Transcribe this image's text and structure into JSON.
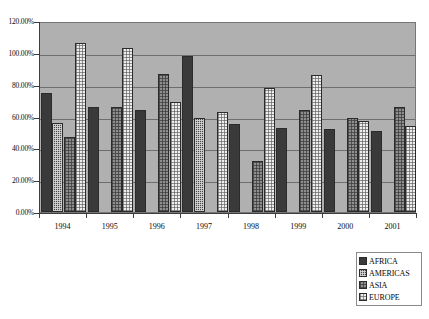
{
  "chart_data": {
    "type": "bar",
    "title": "",
    "xlabel": "",
    "ylabel": "",
    "categories": [
      "1994",
      "1995",
      "1996",
      "1997",
      "1998",
      "1999",
      "2000",
      "2001"
    ],
    "ylim": [
      0,
      120
    ],
    "ytick_labels": [
      "0.00%",
      "20.00%",
      "40.00%",
      "60.00%",
      "80.00%",
      "100.00%",
      "120.00%"
    ],
    "ytick_values": [
      0,
      20,
      40,
      60,
      80,
      100,
      120
    ],
    "grid": true,
    "legend_position": "bottom-right",
    "series": [
      {
        "name": "AFRICA",
        "color": "#3a3a3a",
        "pattern": "solid-dark",
        "values": [
          75,
          66,
          64,
          98,
          55,
          53,
          52,
          51
        ]
      },
      {
        "name": "AMERICAS",
        "color": "#484848",
        "pattern": "dark-checkered",
        "values": [
          56,
          null,
          null,
          59,
          null,
          null,
          null,
          null
        ]
      },
      {
        "name": "ASIA",
        "color": "#8e8e8e",
        "pattern": "gray-dotted",
        "values": [
          47,
          66,
          87,
          null,
          32,
          64,
          59,
          66
        ]
      },
      {
        "name": "EUROPE",
        "color": "#eeeeee",
        "pattern": "light-dotted",
        "values": [
          106,
          103,
          69,
          63,
          78,
          86,
          57,
          54
        ]
      }
    ]
  },
  "legend": {
    "items": [
      {
        "label": "AFRICA"
      },
      {
        "label": "AMERICAS"
      },
      {
        "label": "ASIA"
      },
      {
        "label": "EUROPE"
      }
    ]
  }
}
